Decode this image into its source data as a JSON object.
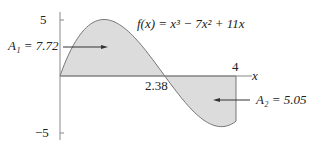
{
  "chart_data": {
    "type": "area",
    "xlabel": "x",
    "ylabel": "",
    "xlim": [
      0,
      4
    ],
    "ylim": [
      -5,
      5
    ],
    "yticks": [
      "5",
      "-5"
    ],
    "xticks": [
      "2.38",
      "4"
    ],
    "function": "x^3 - 7x^2 + 11x",
    "regions": [
      {
        "name": "A1",
        "label": "A₁ = 7.72",
        "from": 0,
        "to": 2.38,
        "area": 7.72
      },
      {
        "name": "A2",
        "label": "A₂ = 5.05",
        "from": 2.38,
        "to": 4,
        "area": 5.05
      }
    ],
    "grid": false
  },
  "labels": {
    "equation": "f(x) = x³ − 7x² + 11x",
    "a1": "A₁ = 7.72",
    "a2": "A₂ = 5.05",
    "x_axis": "x",
    "tick_y_top": "5",
    "tick_y_bottom": "−5",
    "tick_root": "2.38",
    "tick_end": "4"
  }
}
